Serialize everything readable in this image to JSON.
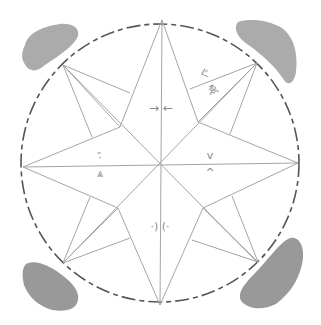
{
  "image": {
    "description": "Pencil sketch of an eight-pointed star compass inside a dashed circle with four grey smudges at the corners",
    "stroke_color": "#9a9a9a",
    "circle_color": "#4a4a4a",
    "smudge_color": "#8c8c8c"
  },
  "symbols": {
    "north": "→ ←",
    "northeast_top": "ぐ",
    "northeast_bottom": "ゑ",
    "west_top": "·̌",
    "west_bottom": "⩓",
    "east_top": "v",
    "east_bottom": "^",
    "south": "·) (·"
  }
}
